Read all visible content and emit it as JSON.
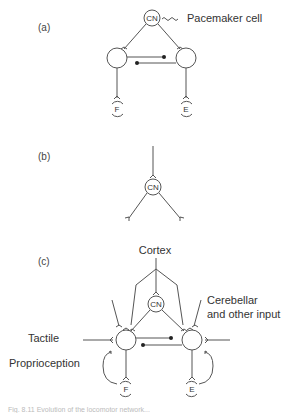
{
  "panels": {
    "a": {
      "label": "(a)",
      "central_node": "CN",
      "pacemaker_label": "Pacemaker cell",
      "motor_left": "F",
      "motor_right": "E"
    },
    "b": {
      "label": "(b)",
      "central_node": "CN"
    },
    "c": {
      "label": "(c)",
      "central_node": "CN",
      "cortex_label": "Cortex",
      "cerebellar_label_line1": "Cerebellar",
      "cerebellar_label_line2": "and other input",
      "tactile_label": "Tactile",
      "proprioception_label": "Proprioception",
      "motor_left": "F",
      "motor_right": "E"
    }
  },
  "caption": {
    "text": "Fig. 8.11 Evolution of the locomotor network..."
  },
  "colors": {
    "line": "#555555",
    "text": "#333333",
    "dot": "#222222",
    "background": "#ffffff"
  }
}
